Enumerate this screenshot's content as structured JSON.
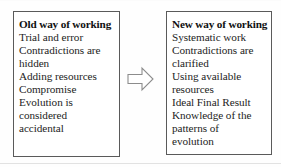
{
  "diagram": {
    "title_visible": false,
    "colors": {
      "box_border": "#5a5a5a",
      "text": "#232323",
      "heading_text": "#111111",
      "background": "#ffffff",
      "arrow_outline": "#8c8c8c"
    },
    "left_box": {
      "heading": "Old way of working",
      "lines": [
        "Trial and error",
        "Contradictions are",
        "hidden",
        "Adding resources",
        "Compromise",
        "Evolution is",
        "considered",
        "accidental"
      ]
    },
    "right_box": {
      "heading": "New way of working",
      "lines": [
        "Systematic work",
        "Contradictions are",
        "clarified",
        "Using available",
        "resources",
        "Ideal Final Result",
        "Knowledge of the",
        "patterns of",
        "evolution"
      ]
    },
    "connector": {
      "icon": "arrow-right-outline-icon",
      "direction": "right",
      "label": ""
    }
  }
}
